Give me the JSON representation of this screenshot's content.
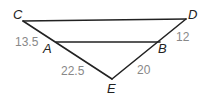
{
  "diagram": {
    "points": {
      "C": {
        "label": "C",
        "x": 23,
        "y": 21
      },
      "D": {
        "label": "D",
        "x": 186,
        "y": 19
      },
      "A": {
        "label": "A",
        "x": 54,
        "y": 42
      },
      "B": {
        "label": "B",
        "x": 160,
        "y": 42
      },
      "E": {
        "label": "E",
        "x": 112,
        "y": 79
      }
    },
    "segments": [
      {
        "from": "C",
        "to": "D"
      },
      {
        "from": "A",
        "to": "B"
      },
      {
        "from": "C",
        "to": "E"
      },
      {
        "from": "D",
        "to": "E"
      }
    ],
    "lengths": {
      "CA": "13.5",
      "AE": "22.5",
      "DB": "12",
      "BE": "20"
    }
  }
}
